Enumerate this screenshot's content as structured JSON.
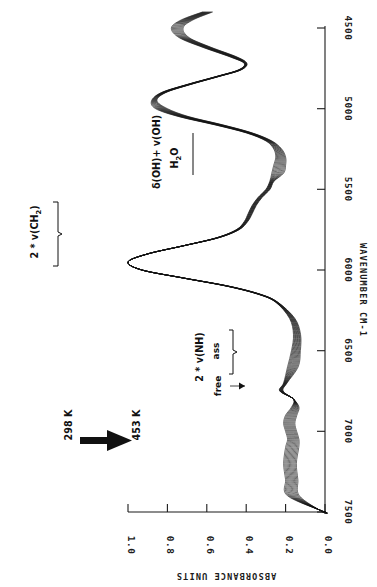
{
  "figure": {
    "kind": "nir-absorbance-spectra-temperature-series",
    "orientation_note": "rotated 90 degrees counter-clockwise",
    "background_color": "#ffffff",
    "trace_color": "#141414"
  },
  "axes": {
    "x": {
      "title": "WAVENUMBER  CM-1",
      "ticks": [
        "7500",
        "7000",
        "6500",
        "6000",
        "5500",
        "5000",
        "4500"
      ],
      "min": 4400,
      "max": 7500,
      "direction": "decreasing-left-to-right-in-rotated-view"
    },
    "y": {
      "title": "ABSORBANCE UNITS",
      "ticks": [
        "0.0",
        "0.2",
        "0.4",
        "0.6",
        "0.8",
        "1.0"
      ],
      "min": 0.0,
      "max": 1.05
    }
  },
  "annotations": {
    "ch2": {
      "label": "2 * v(CH",
      "sub": "2",
      "tail": ")"
    },
    "oh_combo": {
      "label": "δ(OH)+ v(OH)"
    },
    "water": {
      "label": "H",
      "sub": "2",
      "tail": "O"
    },
    "nh": {
      "label": "2 * v(NH)"
    },
    "nh_assoc": {
      "label": "ass"
    },
    "nh_free": {
      "label": "free"
    },
    "temp_start": {
      "label": "298 K"
    },
    "temp_end": {
      "label": "453 K"
    }
  },
  "chart_data": {
    "type": "line",
    "title": "",
    "xlabel": "WAVENUMBER  CM-1",
    "ylabel": "ABSORBANCE UNITS",
    "xlim": [
      4400,
      7500
    ],
    "ylim": [
      0.0,
      1.05
    ],
    "xticks": [
      4500,
      5000,
      5500,
      6000,
      6500,
      7000,
      7500
    ],
    "yticks": [
      0.0,
      0.2,
      0.4,
      0.6,
      0.8,
      1.0
    ],
    "grid": false,
    "legend": "none",
    "x_axis_reversed": true,
    "series_note": "family of 12 spectra recorded from 298 K to 453 K; bands shift/decrease monotonically with temperature",
    "temperatures_K": [
      298,
      312,
      326,
      340,
      354,
      368,
      382,
      396,
      410,
      424,
      438,
      453
    ],
    "x": [
      4400,
      4450,
      4500,
      4560,
      4620,
      4680,
      4720,
      4760,
      4800,
      4850,
      4900,
      4950,
      5000,
      5050,
      5100,
      5150,
      5200,
      5250,
      5300,
      5350,
      5400,
      5450,
      5500,
      5550,
      5600,
      5650,
      5700,
      5750,
      5800,
      5850,
      5900,
      5950,
      6000,
      6050,
      6100,
      6150,
      6200,
      6300,
      6400,
      6500,
      6600,
      6700,
      6750,
      6800,
      6850,
      6900,
      6950,
      7000,
      7050,
      7100,
      7200,
      7300,
      7400,
      7500
    ],
    "series": [
      {
        "name": "298 K",
        "values": [
          0.62,
          0.73,
          0.78,
          0.74,
          0.62,
          0.48,
          0.41,
          0.44,
          0.55,
          0.7,
          0.83,
          0.88,
          0.86,
          0.74,
          0.56,
          0.4,
          0.3,
          0.26,
          0.25,
          0.26,
          0.27,
          0.28,
          0.3,
          0.34,
          0.37,
          0.39,
          0.41,
          0.45,
          0.55,
          0.72,
          0.9,
          1.0,
          0.93,
          0.72,
          0.5,
          0.34,
          0.25,
          0.18,
          0.16,
          0.17,
          0.19,
          0.21,
          0.23,
          0.16,
          0.17,
          0.2,
          0.21,
          0.2,
          0.19,
          0.2,
          0.21,
          0.2,
          0.19,
          0.0
        ]
      },
      {
        "name": "453 K",
        "values": [
          0.56,
          0.66,
          0.71,
          0.68,
          0.57,
          0.44,
          0.38,
          0.41,
          0.52,
          0.66,
          0.78,
          0.82,
          0.8,
          0.69,
          0.52,
          0.37,
          0.27,
          0.22,
          0.2,
          0.2,
          0.21,
          0.22,
          0.24,
          0.28,
          0.31,
          0.33,
          0.36,
          0.41,
          0.52,
          0.7,
          0.89,
          0.99,
          0.92,
          0.71,
          0.48,
          0.32,
          0.23,
          0.15,
          0.12,
          0.12,
          0.13,
          0.14,
          0.16,
          0.16,
          0.13,
          0.14,
          0.15,
          0.14,
          0.13,
          0.13,
          0.14,
          0.13,
          0.12,
          0.0
        ]
      }
    ],
    "band_assignments": [
      {
        "label": "2 * v(CH2)",
        "wavenumber": 5950
      },
      {
        "label": "d(OH)+ v(OH)  H2O",
        "wavenumber": 5150
      },
      {
        "label": "2 * v(NH) free",
        "wavenumber": 6790
      },
      {
        "label": "2 * v(NH) ass",
        "wavenumber": 6600
      }
    ]
  }
}
